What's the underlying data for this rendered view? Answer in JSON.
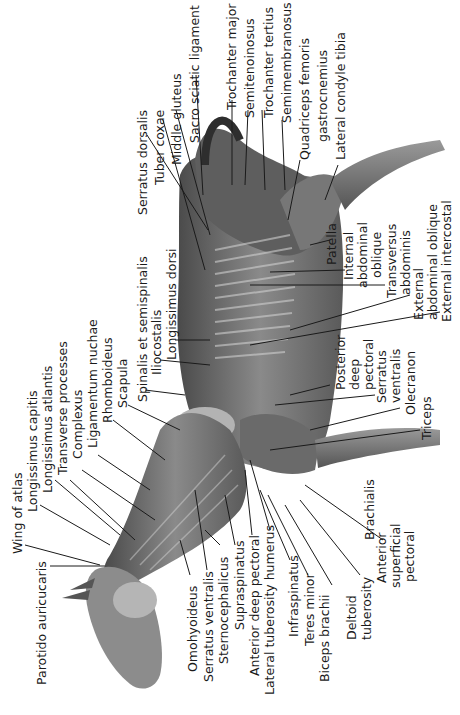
{
  "figure": {
    "orientation": "rotated-counterclockwise"
  },
  "labels": {
    "sacro_sciatic_ligament": "Sacro sciatic ligament",
    "middle_gluteus": "Middle gluteus",
    "tuber_coxae": "Tuber coxae",
    "serratus_dorsalis": "Serratus dorsalis",
    "trochanter_major": "Trochanter major",
    "semitenoinosus": "Semitenoinosus",
    "trochanter_tertius": "Trochanter tertius",
    "semimembranosus": "Semimembranosus",
    "quadriceps_femoris": "Quadriceps femoris",
    "gastrocnemius": "gastrocnemius",
    "lateral_condyle_tibia": "Lateral condyle tibia",
    "patella": "Patella",
    "internal_abdominal_oblique_1": "Internal",
    "internal_abdominal_oblique_2": "abdominal",
    "internal_abdominal_oblique_3": "oblique",
    "transversus_abdominis_1": "Transversus",
    "transversus_abdominis_2": "abdominis",
    "external_abdominal_oblique_1": "External",
    "external_abdominal_oblique_2": "abdominal oblique",
    "external_intercostal": "External intercostal",
    "spinalis_et_semispinalis": "Spinalis et semispinalis",
    "iliocostalis": "Iliocostalis",
    "longissimus_dorsi": "Longissimus dorsi",
    "wing_of_atlas": "Wing of atlas",
    "longissimus_capitis": "Longissimus capitis",
    "longissimus_atlantis": "Longissimus atlantis",
    "transverse_processes": "Transverse processes",
    "complexus": "Complexus",
    "ligamentum_nuchae": "Ligamentum nuchae",
    "rhomboideus": "Rhomboideus",
    "scapula": "Scapula",
    "parotido_auricularis": "Parotido auricucaris",
    "omohyoideus": "Omohyoideus",
    "serratus_ventralis_neck": "Serratus ventralis",
    "sternocephalicus": "Sternocephalicus",
    "supraspinatus": "Supraspinatus",
    "anterior_deep_pectoral": "Anterior deep pectoral",
    "lateral_tuberosity_humerus": "Lateral tuberosity humerus",
    "infraspinatus": "Infraspinatus",
    "teres_minor": "Teres minor",
    "biceps_brachii": "Biceps brachii",
    "deltoid_tuberosity_1": "Deltoid",
    "deltoid_tuberosity_2": "tuberosity",
    "anterior_superficial_pectoral_1": "Anterior",
    "anterior_superficial_pectoral_2": "superficial",
    "anterior_superficial_pectoral_3": "pectoral",
    "brachialis": "Brachialis",
    "posterior_deep_pectoral_1": "Posterior",
    "posterior_deep_pectoral_2": "deep",
    "posterior_deep_pectoral_3": "pectoral",
    "serratus_ventralis_1": "Serratus",
    "serratus_ventralis_2": "ventralis",
    "olecranon": "Olecranon",
    "triceps": "Triceps"
  },
  "colors": {
    "background": "#ffffff",
    "ink": "#1a1a1a",
    "muscle_dark": "#3a3a3a",
    "muscle_mid": "#707070",
    "muscle_light": "#a8a8a8"
  }
}
